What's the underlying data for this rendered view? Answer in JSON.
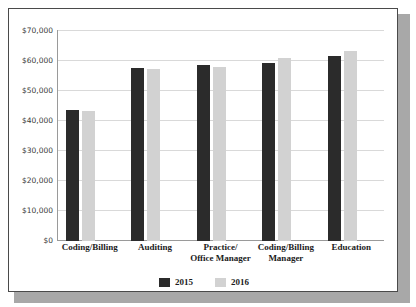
{
  "chart_data": {
    "type": "bar",
    "title": "",
    "xlabel": "",
    "ylabel": "",
    "ylim": [
      0,
      70000
    ],
    "ytick_labels": [
      "$70,000",
      "$60,000",
      "$50,000",
      "$40,000",
      "$30,000",
      "$20,000",
      "$10,000",
      "$0"
    ],
    "ytick_values": [
      70000,
      60000,
      50000,
      40000,
      30000,
      20000,
      10000,
      0
    ],
    "grid": true,
    "legend_position": "bottom-center",
    "categories": [
      "Coding/Billing",
      "Auditing",
      "Practice/\nOffice Manager",
      "Coding/Billing\nManager",
      "Education"
    ],
    "category_lines": [
      [
        "Coding/Billing"
      ],
      [
        "Auditing"
      ],
      [
        "Practice/",
        "Office Manager"
      ],
      [
        "Coding/Billing",
        "Manager"
      ],
      [
        "Education"
      ]
    ],
    "series": [
      {
        "name": "2015",
        "color": "#2b2b2b",
        "values": [
          43700,
          57800,
          58700,
          59200,
          61700
        ]
      },
      {
        "name": "2016",
        "color": "#d2d2d2",
        "values": [
          43300,
          57200,
          58000,
          61000,
          63300
        ]
      }
    ]
  },
  "legend": {
    "items": [
      {
        "label": "2015",
        "color": "#2b2b2b"
      },
      {
        "label": "2016",
        "color": "#d2d2d2"
      }
    ]
  },
  "colors": {
    "series_2015": "#2b2b2b",
    "series_2016": "#d2d2d2",
    "gridline": "#d9d9d9",
    "axis": "#9a9a9a",
    "frame_border": "#4a4a4a",
    "shadow": "#a8a8a8",
    "background": "#ffffff",
    "tick_text": "#3a3a3a",
    "label_text": "#1c1c1c"
  }
}
